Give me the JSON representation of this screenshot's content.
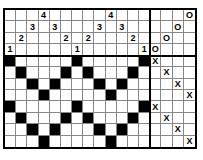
{
  "puzzle": {
    "columns": 17,
    "rows": 12,
    "header_rows": 4,
    "main_columns": 13,
    "clues": [
      {
        "row": 0,
        "col": 3,
        "text": "4"
      },
      {
        "row": 0,
        "col": 9,
        "text": "4"
      },
      {
        "row": 1,
        "col": 2,
        "text": "3"
      },
      {
        "row": 1,
        "col": 4,
        "text": "3"
      },
      {
        "row": 1,
        "col": 8,
        "text": "3"
      },
      {
        "row": 1,
        "col": 10,
        "text": "3"
      },
      {
        "row": 2,
        "col": 1,
        "text": "2"
      },
      {
        "row": 2,
        "col": 5,
        "text": "2"
      },
      {
        "row": 2,
        "col": 7,
        "text": "2"
      },
      {
        "row": 2,
        "col": 11,
        "text": "2"
      },
      {
        "row": 3,
        "col": 0,
        "text": "1"
      },
      {
        "row": 3,
        "col": 6,
        "text": "1"
      },
      {
        "row": 3,
        "col": 12,
        "text": "1"
      }
    ],
    "marks": [
      {
        "row": 0,
        "col": 16,
        "text": "O"
      },
      {
        "row": 1,
        "col": 15,
        "text": "O"
      },
      {
        "row": 2,
        "col": 14,
        "text": "O"
      },
      {
        "row": 3,
        "col": 13,
        "text": "O"
      },
      {
        "row": 4,
        "col": 13,
        "text": "X"
      },
      {
        "row": 5,
        "col": 14,
        "text": "X"
      },
      {
        "row": 6,
        "col": 15,
        "text": "X"
      },
      {
        "row": 7,
        "col": 16,
        "text": "X"
      },
      {
        "row": 8,
        "col": 13,
        "text": "X"
      },
      {
        "row": 9,
        "col": 14,
        "text": "X"
      },
      {
        "row": 10,
        "col": 15,
        "text": "X"
      },
      {
        "row": 11,
        "col": 16,
        "text": "X"
      }
    ],
    "black_cells": [
      [
        4,
        0
      ],
      [
        4,
        6
      ],
      [
        4,
        12
      ],
      [
        5,
        1
      ],
      [
        5,
        5
      ],
      [
        5,
        7
      ],
      [
        5,
        11
      ],
      [
        6,
        2
      ],
      [
        6,
        4
      ],
      [
        6,
        8
      ],
      [
        6,
        10
      ],
      [
        7,
        3
      ],
      [
        7,
        9
      ],
      [
        8,
        0
      ],
      [
        8,
        6
      ],
      [
        8,
        12
      ],
      [
        9,
        1
      ],
      [
        9,
        5
      ],
      [
        9,
        7
      ],
      [
        9,
        11
      ],
      [
        10,
        2
      ],
      [
        10,
        4
      ],
      [
        10,
        8
      ],
      [
        10,
        10
      ],
      [
        11,
        3
      ],
      [
        11,
        9
      ]
    ]
  }
}
